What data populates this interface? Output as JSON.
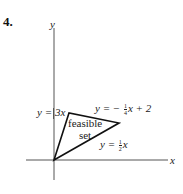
{
  "problem_number": "4.",
  "axes": {
    "x_label": "x",
    "y_label": "y"
  },
  "region_label": {
    "line1": "feasible",
    "line2": "set"
  },
  "constraints": [
    {
      "id": "line_steep",
      "lhs": "y =",
      "rhs": "3x"
    },
    {
      "id": "line_top",
      "lhs": "y = −",
      "frac_num": "1",
      "frac_den": "4",
      "rhs": "x + 2"
    },
    {
      "id": "line_bottom",
      "lhs": "y =",
      "frac_num": "1",
      "frac_den": "2",
      "rhs": "x"
    }
  ],
  "colors": {
    "ink": "#222222",
    "axis": "#555555"
  }
}
